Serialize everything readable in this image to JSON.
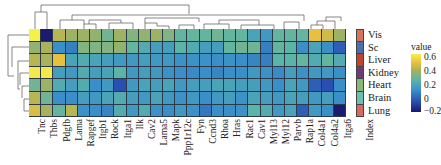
{
  "chart_data": {
    "type": "heatmap",
    "title": "",
    "rows": [
      "Vis",
      "Sc",
      "Liver",
      "Kidney",
      "Heart",
      "Brain",
      "Lung"
    ],
    "columns": [
      "Tnc",
      "Thbs",
      "Pdgfb",
      "Lama",
      "Rapgef",
      "Itgb1",
      "Rock",
      "Itga1",
      "Ilk",
      "Cav2",
      "Lama5",
      "Mapk",
      "Ppp1r12c",
      "Fyn",
      "Ccnd3",
      "Rhoa",
      "Hras",
      "Rac1",
      "Cav1",
      "Myl13",
      "Myl12",
      "Parvb",
      "Rap1a",
      "Col4a1",
      "Col4a2",
      "Itga6"
    ],
    "values": [
      [
        0.6,
        -0.2,
        0.35,
        0.3,
        0.3,
        0.28,
        0.22,
        0.3,
        0.25,
        0.28,
        0.3,
        0.25,
        0.2,
        0.2,
        0.2,
        0.22,
        0.2,
        0.2,
        0.12,
        0.08,
        0.2,
        0.2,
        0.2,
        0.45,
        0.4,
        0.3
      ],
      [
        0.28,
        0.32,
        0.05,
        0.02,
        0.25,
        0.25,
        0.25,
        0.28,
        0.2,
        0.15,
        0.1,
        0.1,
        0.18,
        0.15,
        0.1,
        0.1,
        0.2,
        0.22,
        0.22,
        0.02,
        0.2,
        0.18,
        0.05,
        0.12,
        0.05,
        -0.05
      ],
      [
        0.35,
        0.32,
        0.45,
        0.12,
        0.15,
        0.12,
        0.1,
        0.08,
        0.08,
        0.1,
        0.08,
        0.08,
        0.06,
        0.06,
        0.06,
        0.05,
        0.06,
        0.05,
        0.03,
        0.02,
        0.18,
        0.18,
        0.2,
        0.15,
        0.2,
        0.15
      ],
      [
        0.58,
        0.58,
        0.1,
        0.08,
        0.15,
        0.1,
        0.12,
        0.18,
        0.08,
        0.1,
        0.08,
        0.06,
        0.05,
        0.04,
        0.05,
        0.03,
        0.05,
        0.05,
        0.08,
        0.06,
        0.04,
        0.1,
        0.06,
        0.08,
        0.08,
        0.05
      ],
      [
        0.22,
        0.3,
        0.15,
        0.1,
        0.15,
        0.05,
        0.08,
        -0.08,
        0.08,
        0.12,
        0.1,
        0.12,
        0.08,
        0.1,
        0.1,
        0.12,
        0.12,
        0.1,
        0.1,
        0.08,
        0.05,
        0.12,
        0.08,
        -0.05,
        -0.08,
        0.05
      ],
      [
        0.35,
        0.22,
        0.05,
        0.05,
        0.1,
        0.08,
        0.12,
        0.15,
        0.1,
        0.08,
        0.12,
        0.08,
        0.06,
        0.08,
        0.05,
        0.08,
        0.1,
        0.06,
        0.12,
        0.1,
        0.08,
        0.12,
        0.1,
        0.08,
        0.1,
        0.05
      ],
      [
        0.42,
        0.32,
        0.2,
        0.35,
        0.06,
        0.05,
        0.03,
        0.15,
        0.08,
        0.15,
        0.06,
        0.05,
        0.08,
        0.06,
        0.0,
        0.05,
        0.05,
        0.06,
        0.18,
        0.15,
        0.08,
        0.12,
        -0.05,
        0.08,
        0.05,
        -0.2
      ]
    ],
    "row_annotation": {
      "label": "Index",
      "colors": [
        "#d8735a",
        "#4a6fb0",
        "#c0432e",
        "#6a3c7a",
        "#8ab872",
        "#6cc0b2",
        "#d86a5a"
      ]
    },
    "colorbar": {
      "title": "value",
      "ticks": [
        "0.6",
        "0.4",
        "0.2",
        "0",
        "−0.2"
      ],
      "range": [
        -0.2,
        0.6
      ],
      "colors": [
        "#1a1a6e",
        "#2a4fb0",
        "#3a8fc8",
        "#5ab4a8",
        "#a9b25a",
        "#e8c040",
        "#f5f04a"
      ]
    },
    "dendrograms": {
      "rows": true,
      "columns": true
    },
    "grid": false,
    "legend_position": "right"
  }
}
